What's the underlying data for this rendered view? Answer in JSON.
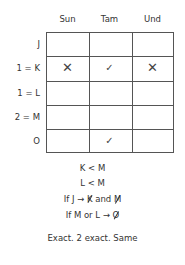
{
  "grid": {
    "columns": [
      "Sun",
      "Tam",
      "Und"
    ],
    "rows": [
      {
        "label": "J",
        "marks": [
          "",
          "",
          ""
        ]
      },
      {
        "label": "1 = K",
        "marks": [
          "✕",
          "✓",
          "✕"
        ]
      },
      {
        "label": "1 = L",
        "marks": [
          "",
          "",
          ""
        ]
      },
      {
        "label": "2 = M",
        "marks": [
          "",
          "",
          ""
        ]
      },
      {
        "label": "O",
        "marks": [
          "",
          "✓",
          ""
        ]
      }
    ]
  },
  "rules": {
    "rule1": "K < M",
    "rule2": "L < M",
    "rule3": {
      "prefix": "If J →",
      "struck1": "K",
      "middle": "and",
      "struck2": "M"
    },
    "rule4": {
      "prefix": "If M or L →",
      "struck1": "O"
    },
    "summary": "Exact. 2 exact. Same"
  }
}
